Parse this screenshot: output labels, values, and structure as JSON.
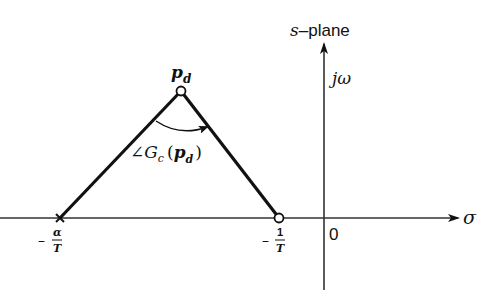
{
  "header_fragment": "",
  "plane_label": {
    "var": "s",
    "dash": "–",
    "word": "plane"
  },
  "imag_axis_label": "jω",
  "real_axis_label": "σ",
  "origin_label": "0",
  "desired_pole_label": {
    "base": "p",
    "sub": "d"
  },
  "angle_label": {
    "angle": "∠",
    "G": "G",
    "sub": "c",
    "open": "(",
    "p": "p",
    "psub": "d",
    "close": ")"
  },
  "pole_label": {
    "minus": "–",
    "num": "α",
    "den": "T"
  },
  "zero_label": {
    "minus": "–",
    "num": "1",
    "den": "T"
  },
  "colors": {
    "ink": "#111111",
    "background": "#ffffff"
  }
}
